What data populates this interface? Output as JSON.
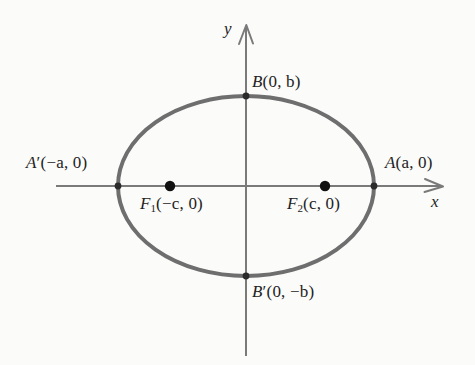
{
  "figure": {
    "kind": "ellipse-diagram",
    "background_color": "#fbfbfa",
    "curve_color": "#6e6e6e",
    "axis_color": "#7a7a7a",
    "point_color": "#1a1a1a",
    "text_color": "#232323"
  },
  "axes": {
    "x_label": "x",
    "y_label": "y",
    "origin": {
      "x": 246,
      "y": 186
    },
    "x_line": {
      "x1": 56,
      "x2": 443,
      "y": 186
    },
    "y_line": {
      "x": 246,
      "y1": 25,
      "y2": 356
    }
  },
  "ellipse": {
    "center_x": 246,
    "center_y": 186,
    "semi_major_a": 128,
    "semi_minor_b": 90,
    "stroke_width": 4
  },
  "labels": {
    "top_vertex": {
      "name": "B",
      "prime": "",
      "coords": "(0, b)",
      "text": "B(0, b)"
    },
    "bottom_vertex": {
      "name": "B",
      "prime": "′",
      "coords": "(0, −b)",
      "text": "B′(0, −b)"
    },
    "left_vertex": {
      "name": "A",
      "prime": "′",
      "coords": "(−a, 0)",
      "text": "A′(−a, 0)"
    },
    "right_vertex": {
      "name": "A",
      "prime": "",
      "coords": "(a, 0)",
      "text": "A(a, 0)"
    },
    "focus_left": {
      "name": "F",
      "subscript": "1",
      "coords": "(−c, 0)",
      "text": "F1(−c, 0)"
    },
    "focus_right": {
      "name": "F",
      "subscript": "2",
      "coords": "(c, 0)",
      "text": "F2(c, 0)"
    }
  },
  "points": [
    {
      "id": "top-vertex",
      "label": "B(0, b)",
      "x": 246,
      "y": 96,
      "marker": "small-dot"
    },
    {
      "id": "bottom-vertex",
      "label": "B′(0, −b)",
      "x": 246,
      "y": 276,
      "marker": "small-dot"
    },
    {
      "id": "left-vertex",
      "label": "A′(−a, 0)",
      "x": 118,
      "y": 186,
      "marker": "small-dot"
    },
    {
      "id": "right-vertex",
      "label": "A(a, 0)",
      "x": 374,
      "y": 186,
      "marker": "small-dot"
    },
    {
      "id": "focus-left",
      "label": "F1(−c, 0)",
      "x": 170,
      "y": 186,
      "marker": "large-dot"
    },
    {
      "id": "focus-right",
      "label": "F2(c, 0)",
      "x": 325,
      "y": 186,
      "marker": "large-dot"
    }
  ]
}
